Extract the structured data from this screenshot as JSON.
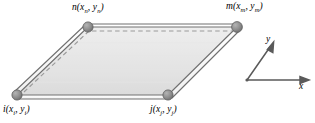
{
  "figure": {
    "type": "geometry-diagram",
    "background_color": "#ffffff",
    "stroke_color": "#6e6e6e",
    "node_fill_color": "#8a8a8a",
    "dashed_color": "#9a9a9a",
    "fill_light": "#f2f2f2",
    "fill_dark": "#dcdcdc"
  },
  "vertices": [
    {
      "id": "n",
      "label": "n(x",
      "sub1": "n",
      "mid": ", y",
      "sub2": "n",
      "close": ")",
      "full_label": "n(xn, yn)",
      "point": {
        "x": 88,
        "y": 27
      }
    },
    {
      "id": "m",
      "label": "m(x",
      "sub1": "m",
      "mid": ", y",
      "sub2": "m",
      "close": ")",
      "full_label": "m(xm, ym)",
      "point": {
        "x": 237,
        "y": 27
      }
    },
    {
      "id": "i",
      "label": "i(x",
      "sub1": "i",
      "mid": ", y",
      "sub2": "i",
      "close": ")",
      "full_label": "i(xi, yi)",
      "point": {
        "x": 17,
        "y": 95
      }
    },
    {
      "id": "j",
      "label": "j(x",
      "sub1": "j",
      "mid": ", y",
      "sub2": "j",
      "close": ")",
      "full_label": "j(xj, yj)",
      "point": {
        "x": 168,
        "y": 95
      }
    }
  ],
  "axes": {
    "origin": {
      "x": 247,
      "y": 80
    },
    "x_axis": {
      "label": "x",
      "tip": {
        "x": 307,
        "y": 80
      }
    },
    "y_axis": {
      "label": "y",
      "tip": {
        "x": 272,
        "y": 44
      }
    }
  },
  "edges": [
    {
      "from": "i",
      "to": "j",
      "style": "solid-double"
    },
    {
      "from": "j",
      "to": "m",
      "style": "solid-double"
    },
    {
      "from": "i",
      "to": "n",
      "style": "solid-double"
    },
    {
      "from": "n",
      "to": "m",
      "style": "solid-double"
    }
  ],
  "guides": [
    {
      "from": "i",
      "to": "n",
      "style": "dashed-inset"
    },
    {
      "from": "n",
      "to": "m",
      "style": "dashed-inset"
    }
  ]
}
